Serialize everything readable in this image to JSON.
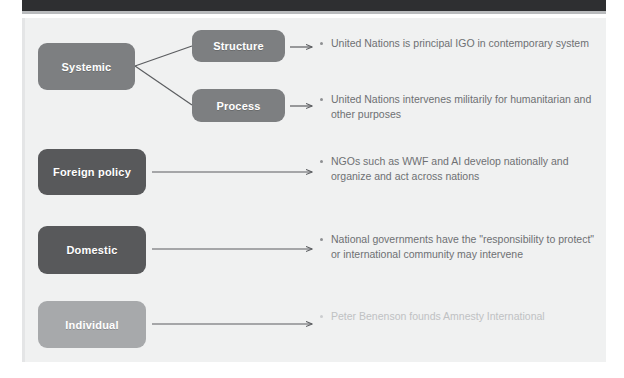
{
  "figure": {
    "type": "levels-of-analysis-diagram",
    "colors": {
      "panel_background": "#f0f1f1",
      "top_band": "#2e2f31",
      "box_medium_gray": "#7d7f81",
      "box_dark_gray": "#58595b",
      "box_light_gray": "#a7a9ab",
      "text_gray": "#6e7073",
      "text_faded_gray": "#bfc1c3",
      "connector_line": "#5b5d60"
    },
    "levels": [
      {
        "id": "systemic",
        "label": "Systemic",
        "shade": "medium",
        "children": [
          {
            "id": "structure",
            "label": "Structure",
            "shade": "medium",
            "bullet": "United Nations is principal IGO in contemporary system"
          },
          {
            "id": "process",
            "label": "Process",
            "shade": "medium",
            "bullet": "United Nations intervenes militarily for humanitarian and other purposes"
          }
        ]
      },
      {
        "id": "foreign-policy",
        "label": "Foreign policy",
        "shade": "dark",
        "bullet": "NGOs such as WWF and AI develop nationally and organize and act across nations"
      },
      {
        "id": "domestic",
        "label": "Domestic",
        "shade": "dark",
        "bullet": "National governments have the \"responsibility to protect\" or international community may intervene"
      },
      {
        "id": "individual",
        "label": "Individual",
        "shade": "light",
        "bullet": "Peter Benenson founds Amnesty International"
      }
    ]
  }
}
